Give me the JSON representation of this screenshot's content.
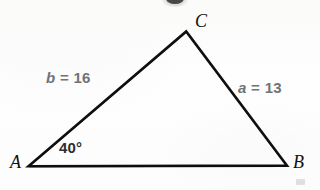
{
  "figure": {
    "type": "triangle-diagram",
    "background_color": "#fdfdfc",
    "stroke_color": "#111111",
    "side_label_color": "#6e7376",
    "angle_label_color": "#2c2f31",
    "vertex_label_color": "#111111",
    "vertices": {
      "A": {
        "label": "A",
        "x": 28,
        "y": 166,
        "label_x": 10,
        "label_y": 153
      },
      "B": {
        "label": "B",
        "x": 287,
        "y": 166,
        "label_x": 293,
        "label_y": 153
      },
      "C": {
        "label": "C",
        "x": 186,
        "y": 31,
        "label_x": 195,
        "label_y": 12
      }
    },
    "sides": [
      {
        "name": "b",
        "label": "b = 16",
        "variable": "b",
        "equals": "=",
        "value": "16",
        "from": "A",
        "to": "C",
        "label_x": 46,
        "label_y": 70
      },
      {
        "name": "a",
        "label": "a = 13",
        "variable": "a",
        "equals": "=",
        "value": "13",
        "from": "C",
        "to": "B",
        "label_x": 238,
        "label_y": 80
      },
      {
        "name": "c",
        "label": "",
        "variable": "c",
        "equals": "",
        "value": "",
        "from": "A",
        "to": "B",
        "label_x": 0,
        "label_y": 0
      }
    ],
    "angles": [
      {
        "at": "A",
        "label": "40°",
        "value": "40",
        "unit": "°",
        "label_x": 59,
        "label_y": 140
      }
    ]
  },
  "chart_data": {
    "type": "diagram",
    "title": "",
    "shape": "triangle",
    "points": {
      "A": [
        28,
        166
      ],
      "B": [
        287,
        166
      ],
      "C": [
        186,
        31
      ]
    },
    "labels": [
      "A",
      "B",
      "C"
    ],
    "annotations": [
      "b = 16",
      "a = 13",
      "40°"
    ],
    "side_lengths": {
      "a": 13,
      "b": 16,
      "c": null
    },
    "angles_deg": {
      "A": 40,
      "B": null,
      "C": null
    }
  }
}
